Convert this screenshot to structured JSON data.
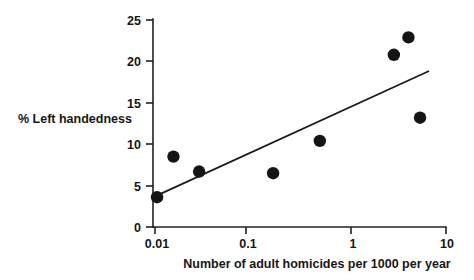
{
  "chart_data": {
    "type": "scatter",
    "title": "",
    "xlabel": "Number of adult homicides per 1000 per year",
    "ylabel": "% Left handedness",
    "x_scale": "log",
    "y_scale": "linear",
    "xlim": [
      0.01,
      10
    ],
    "ylim": [
      0,
      25
    ],
    "x_ticks": [
      0.01,
      0.1,
      1,
      10
    ],
    "x_tick_labels": [
      "0.01",
      "0.1",
      "1",
      "10"
    ],
    "y_ticks": [
      0,
      5,
      10,
      15,
      20,
      25
    ],
    "y_tick_labels": [
      "0",
      "5",
      "10",
      "15",
      "20",
      "25"
    ],
    "grid": false,
    "legend": false,
    "legend_position": "none",
    "marker": "filled-circle",
    "marker_color": "#151515",
    "points": [
      {
        "x": 0.0105,
        "y": 3.6
      },
      {
        "x": 0.0155,
        "y": 8.5
      },
      {
        "x": 0.0285,
        "y": 6.7
      },
      {
        "x": 0.165,
        "y": 6.5
      },
      {
        "x": 0.5,
        "y": 10.4
      },
      {
        "x": 2.9,
        "y": 20.8
      },
      {
        "x": 4.1,
        "y": 22.9
      },
      {
        "x": 5.4,
        "y": 13.2
      }
    ],
    "trend_line": {
      "type": "linear-fit-on-log-x",
      "start": {
        "x": 0.01,
        "y": 3.7
      },
      "end": {
        "x": 6.6,
        "y": 18.8
      },
      "color": "#1a1a1a"
    },
    "annotations": []
  },
  "axes": {
    "x_title": "Number of adult homicides per 1000 per year",
    "y_title": "% Left handedness"
  },
  "ticks": {
    "x": [
      "0.01",
      "0.1",
      "1",
      "10"
    ],
    "y": [
      "25",
      "20",
      "15",
      "10",
      "5",
      "0"
    ]
  }
}
